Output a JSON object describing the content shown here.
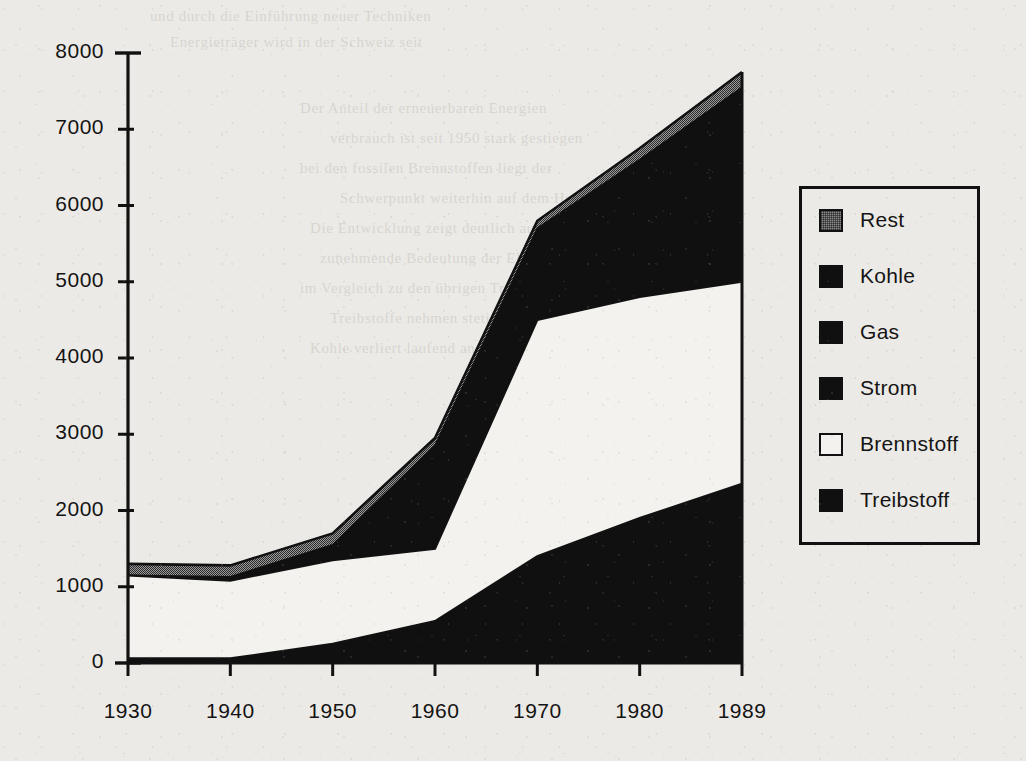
{
  "chart_data": {
    "type": "area",
    "stacked": true,
    "title": "",
    "subtitle": "",
    "xlabel": "",
    "ylabel": "",
    "x": [
      1930,
      1940,
      1950,
      1960,
      1970,
      1980,
      1989
    ],
    "xtick_labels": [
      "1930",
      "1940",
      "1950",
      "1960",
      "1970",
      "1980",
      "1989"
    ],
    "ytick_labels": [
      "0",
      "1000",
      "2000",
      "3000",
      "4000",
      "5000",
      "6000",
      "7000",
      "8000"
    ],
    "ytick_values": [
      0,
      1000,
      2000,
      3000,
      4000,
      5000,
      6000,
      7000,
      8000
    ],
    "xlim": [
      1930,
      1989
    ],
    "ylim": [
      0,
      8000
    ],
    "grid": false,
    "legend_position": "right",
    "series": [
      {
        "name": "Treibstoff",
        "color": "#101010",
        "values": [
          60,
          60,
          250,
          550,
          1400,
          1900,
          2350
        ]
      },
      {
        "name": "Brennstoff",
        "color": "#f4f2ee",
        "values": [
          1090,
          1020,
          1100,
          950,
          3100,
          2900,
          2650
        ]
      },
      {
        "name": "Strom",
        "color": "#101010",
        "values": [
          0,
          0,
          0,
          0,
          0,
          0,
          0
        ]
      },
      {
        "name": "Gas",
        "color": "#101010",
        "values": [
          0,
          0,
          0,
          0,
          0,
          0,
          0
        ]
      },
      {
        "name": "Kohle",
        "color": "#101010",
        "values": [
          0,
          200,
          200,
          1400,
          1300,
          1850,
          2550
        ]
      },
      {
        "name": "Rest",
        "color": "#8a8a8a",
        "values": [
          150,
          150,
          150,
          100,
          100,
          150,
          200
        ]
      }
    ],
    "cumulative_totals": [
      1300,
      1280,
      1700,
      2950,
      5800,
      6750,
      7750
    ],
    "stack_boundaries": {
      "treibstoff_top": [
        60,
        60,
        250,
        550,
        1400,
        1900,
        2350
      ],
      "brennstoff_top": [
        1150,
        1080,
        1350,
        1500,
        4500,
        4800,
        5000
      ],
      "dark_top": [
        1150,
        1130,
        1550,
        2850,
        5700,
        6600,
        7550
      ],
      "rest_top": [
        1300,
        1280,
        1700,
        2950,
        5800,
        6750,
        7750
      ]
    }
  },
  "legend": {
    "items": [
      {
        "label": "Rest",
        "swatch": "gray"
      },
      {
        "label": "Kohle",
        "swatch": "black"
      },
      {
        "label": "Gas",
        "swatch": "black"
      },
      {
        "label": "Strom",
        "swatch": "black"
      },
      {
        "label": "Brennstoff",
        "swatch": "white"
      },
      {
        "label": "Treibstoff",
        "swatch": "black"
      }
    ]
  },
  "colors": {
    "ink": "#141414",
    "area_dark": "#101010",
    "area_gray": "#8a8a8a",
    "area_white": "#f4f2ee",
    "paper": "#eceae6"
  },
  "background_text": {
    "lines": [
      "und durch die Einführung neuer Techniken",
      "Energieträger wird in der Schweiz seit",
      "Der Anteil der erneuerbaren Energien",
      "verbrauch ist seit 1950 stark gestiegen",
      "bei den fossilen Brennstoffen liegt der",
      "Schwerpunkt weiterhin auf dem Heizöl",
      "Die Entwicklung zeigt deutlich auf die",
      "zunehmende Bedeutung der Elektrizität",
      "im Vergleich zu den übrigen Trägern",
      "Treibstoffe nehmen stetig zu seit 1960",
      "Kohle verliert laufend an Bedeutung"
    ]
  }
}
